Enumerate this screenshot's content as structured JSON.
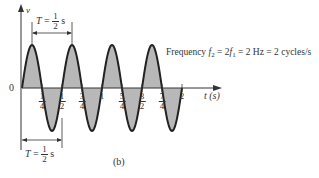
{
  "figure": {
    "caption": "(b)",
    "y_axis_label": "v",
    "x_axis_label": "t (s)",
    "origin_label": "0",
    "period_top": {
      "symbol": "T",
      "eq": "=",
      "num": "1",
      "den": "2",
      "unit": "s"
    },
    "period_bottom": {
      "symbol": "T",
      "eq": "=",
      "num": "1",
      "den": "2",
      "unit": "s"
    },
    "frequency_annotation": {
      "prefix": "Frequency ",
      "f2": "f",
      "f2_sub": "2",
      "mid": " = 2",
      "f1": "f",
      "f1_sub": "1",
      "suffix": " = 2 Hz = 2 cycles/s"
    },
    "ticks": [
      {
        "num": "1",
        "den": "4",
        "x": 42
      },
      {
        "num": "1",
        "den": "2",
        "x": 62
      },
      {
        "num": "3",
        "den": "4",
        "x": 82
      },
      {
        "num": "1",
        "den": "",
        "x": 102
      },
      {
        "num": "5",
        "den": "4",
        "x": 122
      },
      {
        "num": "3",
        "den": "2",
        "x": 142
      },
      {
        "num": "7",
        "den": "4",
        "x": 162
      },
      {
        "num": "2",
        "den": "",
        "x": 182
      }
    ],
    "colors": {
      "fill": "#b8b8b8",
      "stroke": "#222222",
      "axis": "#333333"
    }
  },
  "chart_data": {
    "type": "line",
    "title": "",
    "xlabel": "t (s)",
    "ylabel": "v",
    "function": "sine",
    "frequency_hz": 2,
    "period_s": 0.5,
    "x_range": [
      0,
      2
    ],
    "x_ticks": [
      "1/4",
      "1/2",
      "3/4",
      "1",
      "5/4",
      "3/2",
      "7/4",
      "2"
    ],
    "cycles": 4,
    "annotations": [
      "T = 1/2 s",
      "T = 1/2 s",
      "Frequency f2 = 2 f1 = 2 Hz = 2 cycles/s"
    ],
    "grid": false,
    "shaded_area_under_curve": true
  }
}
